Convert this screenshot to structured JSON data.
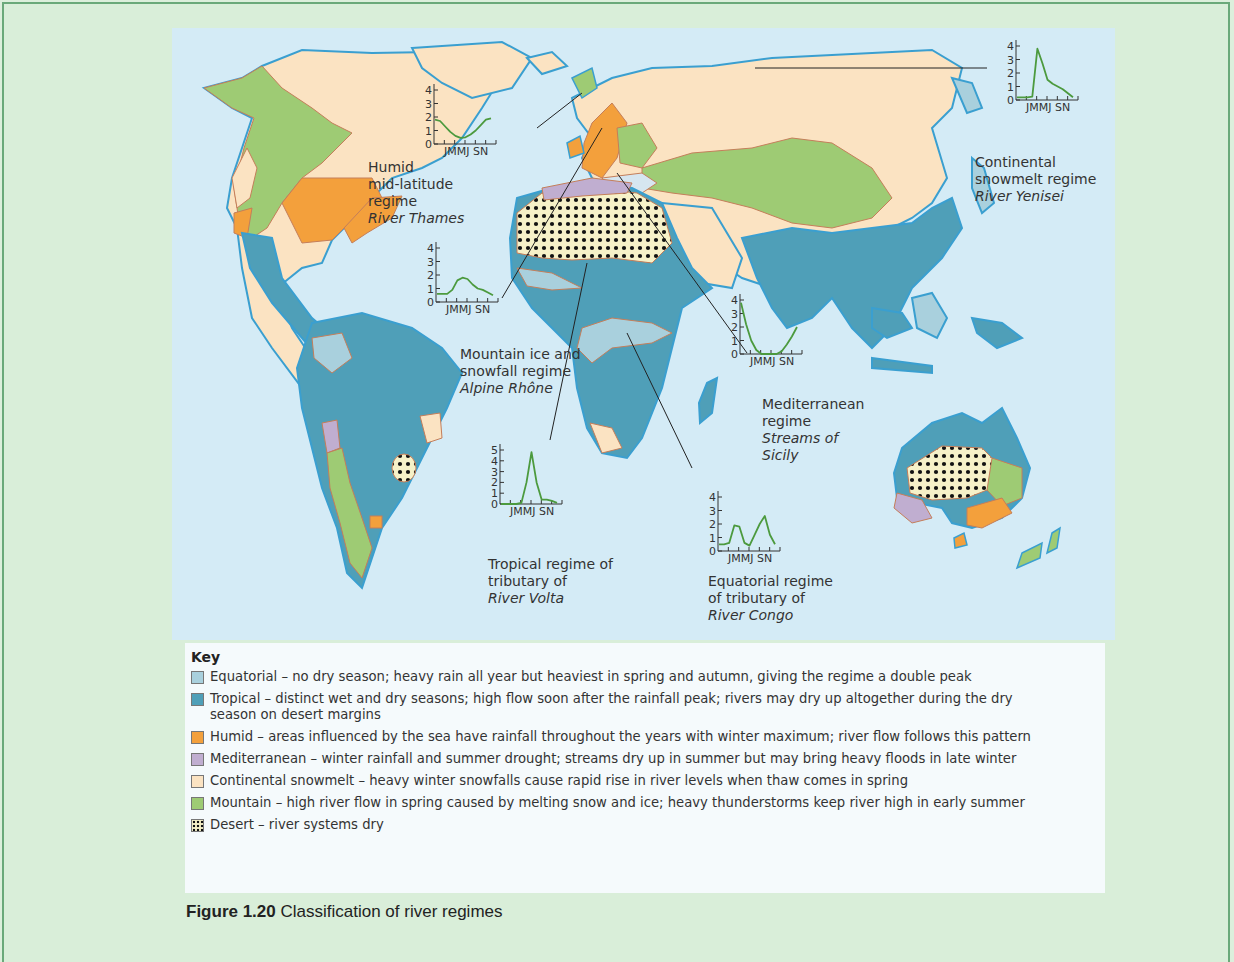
{
  "figure": {
    "number": "Figure 1.20",
    "title": "Classification of river regimes"
  },
  "colors": {
    "ocean": "#d4ebf6",
    "coast": "#3a9fd0",
    "equatorial": "#a9d0dd",
    "tropical": "#4f9fb8",
    "humid": "#f3a03c",
    "mediterranean": "#c0aed0",
    "continental": "#fbe3c2",
    "mountain": "#9ecb74",
    "desert": "#f6f1c8",
    "hydrograph_line": "#4c9a3e",
    "border": "#c47e5a"
  },
  "labels": {
    "thames": {
      "line1": "Humid",
      "line2": "mid-latitude",
      "line3": "regime",
      "river": "River Thames"
    },
    "yenisei": {
      "line1": "Continental",
      "line2": "snowmelt regime",
      "river": "River Yenisei"
    },
    "rhone": {
      "line1": "Mountain ice and",
      "line2": "snowfall regime",
      "river": "Alpine Rhône"
    },
    "sicily": {
      "line1": "Mediterranean",
      "line2": "regime",
      "river_line1": "Streams of",
      "river_line2": "Sicily"
    },
    "volta": {
      "line1": "Tropical regime of",
      "line2": "tributary of",
      "river": "River Volta"
    },
    "congo": {
      "line1": "Equatorial regime",
      "line2": "of tributary of",
      "river": "River Congo"
    }
  },
  "axis": {
    "months_label": "JMMJ SN",
    "ticks": [
      "0",
      "1",
      "2",
      "3",
      "4"
    ]
  },
  "chart_data": [
    {
      "type": "line",
      "title": "Humid mid-latitude regime – River Thames",
      "x": [
        "J",
        "F",
        "M",
        "A",
        "M",
        "J",
        "J",
        "A",
        "S",
        "O",
        "N",
        "D"
      ],
      "values": [
        1.8,
        1.7,
        1.3,
        0.9,
        0.6,
        0.45,
        0.5,
        0.7,
        1.0,
        1.4,
        1.8,
        1.9
      ],
      "xlabel": "JMMJ SN",
      "ylabel": "",
      "ylim": [
        0,
        4
      ]
    },
    {
      "type": "line",
      "title": "Continental snowmelt regime – River Yenisei",
      "x": [
        "J",
        "F",
        "M",
        "A",
        "M",
        "J",
        "J",
        "A",
        "S",
        "O",
        "N",
        "D"
      ],
      "values": [
        0.2,
        0.2,
        0.2,
        0.25,
        3.8,
        2.7,
        1.5,
        1.2,
        1.0,
        0.8,
        0.5,
        0.2
      ],
      "xlabel": "JMMJ SN",
      "ylabel": "",
      "ylim": [
        0,
        4
      ]
    },
    {
      "type": "line",
      "title": "Mountain ice and snowfall regime – Alpine Rhône",
      "x": [
        "J",
        "F",
        "M",
        "A",
        "M",
        "J",
        "J",
        "A",
        "S",
        "O",
        "N",
        "D"
      ],
      "values": [
        0.6,
        0.6,
        0.6,
        0.9,
        1.6,
        1.8,
        1.7,
        1.3,
        1.0,
        0.9,
        0.7,
        0.5
      ],
      "xlabel": "JMMJ SN",
      "ylabel": "",
      "ylim": [
        0,
        4
      ]
    },
    {
      "type": "line",
      "title": "Mediterranean regime – Streams of Sicily",
      "x": [
        "J",
        "F",
        "M",
        "A",
        "M",
        "J",
        "J",
        "A",
        "S",
        "O",
        "N",
        "D"
      ],
      "values": [
        3.8,
        2.2,
        1.0,
        0.3,
        0.0,
        0.0,
        0.0,
        0.0,
        0.2,
        0.7,
        1.3,
        2.0
      ],
      "xlabel": "JMMJ SN",
      "ylabel": "",
      "ylim": [
        0,
        4
      ]
    },
    {
      "type": "line",
      "title": "Tropical regime of tributary of River Volta",
      "x": [
        "J",
        "F",
        "M",
        "A",
        "M",
        "J",
        "J",
        "A",
        "S",
        "O",
        "N",
        "D"
      ],
      "values": [
        0,
        0,
        0,
        0,
        0.1,
        2.0,
        4.8,
        2.0,
        0.4,
        0.4,
        0.3,
        0.1
      ],
      "xlabel": "JMMJ SN",
      "ylabel": "",
      "ylim": [
        0,
        5
      ]
    },
    {
      "type": "line",
      "title": "Equatorial regime of tributary of River Congo",
      "x": [
        "J",
        "F",
        "M",
        "A",
        "M",
        "J",
        "J",
        "A",
        "S",
        "O",
        "N",
        "D"
      ],
      "values": [
        0.5,
        0.5,
        0.6,
        1.9,
        1.8,
        0.6,
        0.4,
        1.2,
        2.0,
        2.6,
        1.2,
        0.5
      ],
      "xlabel": "JMMJ SN",
      "ylabel": "",
      "ylim": [
        0,
        4
      ]
    }
  ],
  "key": {
    "title": "Key",
    "items": [
      {
        "name": "Equatorial",
        "text": "Equatorial – no dry season; heavy rain all year but heaviest in spring and autumn, giving the regime a double peak"
      },
      {
        "name": "Tropical",
        "text": "Tropical – distinct wet and dry seasons; high flow soon after the rainfall peak; rivers may dry up altogether during the dry season on desert margins"
      },
      {
        "name": "Humid",
        "text": "Humid – areas influenced by the sea have rainfall throughout the years with winter maximum; river flow follows this pattern"
      },
      {
        "name": "Mediterranean",
        "text": "Mediterranean – winter rainfall and summer drought; streams dry up in summer but may bring heavy floods in late winter"
      },
      {
        "name": "Continental snowmelt",
        "text": "Continental snowmelt – heavy winter snowfalls cause rapid rise in river levels when thaw comes in spring"
      },
      {
        "name": "Mountain",
        "text": "Mountain – high river flow in spring caused by melting snow and ice; heavy thunderstorms keep river high in early summer"
      },
      {
        "name": "Desert",
        "text": "Desert – river systems dry"
      }
    ]
  }
}
